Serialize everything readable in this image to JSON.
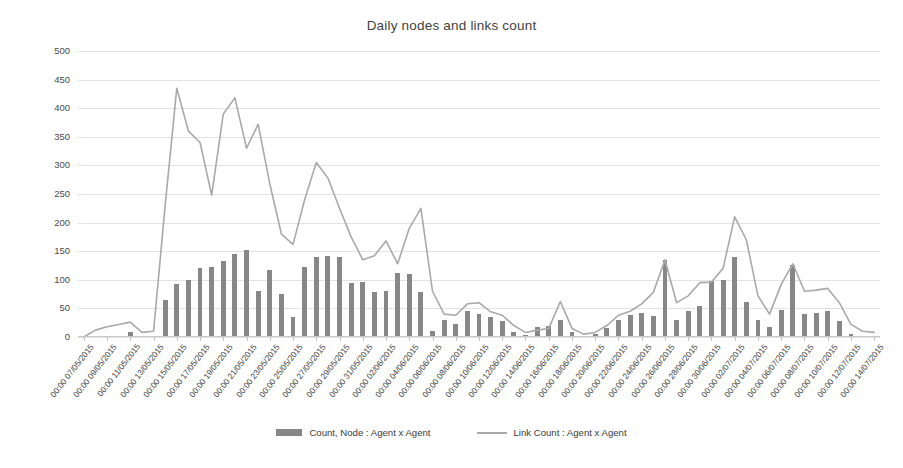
{
  "chart": {
    "title": "Daily nodes and links count",
    "legend": {
      "bar_label": "Count, Node : Agent x Agent",
      "line_label": "Link Count : Agent x Agent",
      "bar_color": "#878787",
      "line_color": "#a9a9a9",
      "position": "bottom"
    }
  },
  "chart_data": {
    "type": "bar",
    "title": "Daily nodes and links count",
    "xlabel": "",
    "ylabel": "",
    "ylim": [
      0,
      500
    ],
    "ytick_step": 50,
    "yticks": [
      0,
      50,
      100,
      150,
      200,
      250,
      300,
      350,
      400,
      450,
      500
    ],
    "grid": true,
    "x_tick_labels": [
      "00:00 07/05/2015",
      "00:00 09/05/2015",
      "00:00 11/05/2015",
      "00:00 13/05/2015",
      "00:00 15/05/2015",
      "00:00 17/05/2015",
      "00:00 19/05/2015",
      "00:00 21/05/2015",
      "00:00 23/05/2015",
      "00:00 25/05/2015",
      "00:00 27/05/2015",
      "00:00 29/05/2015",
      "00:00 31/05/2015",
      "00:00 02/06/2015",
      "00:00 04/06/2015",
      "00:00 06/06/2015",
      "00:00 08/06/2015",
      "00:00 10/06/2015",
      "00:00 12/06/2015",
      "00:00 14/06/2015",
      "00:00 16/06/2015",
      "00:00 18/06/2015",
      "00:00 20/06/2015",
      "00:00 22/06/2015",
      "00:00 24/06/2015",
      "00:00 26/06/2015",
      "00:00 28/06/2015",
      "00:00 30/06/2015",
      "00:00 02/07/2015",
      "00:00 04/07/2015",
      "00:00 06/07/2015",
      "00:00 08/07/2015",
      "00:00 10/07/2015",
      "00:00 12/07/2015",
      "00:00 14/07/2015"
    ],
    "categories": [
      "07/05/2015",
      "08/05/2015",
      "09/05/2015",
      "10/05/2015",
      "11/05/2015",
      "12/05/2015",
      "13/05/2015",
      "14/05/2015",
      "15/05/2015",
      "16/05/2015",
      "17/05/2015",
      "18/05/2015",
      "19/05/2015",
      "20/05/2015",
      "21/05/2015",
      "22/05/2015",
      "23/05/2015",
      "24/05/2015",
      "25/05/2015",
      "26/05/2015",
      "27/05/2015",
      "28/05/2015",
      "29/05/2015",
      "30/05/2015",
      "31/05/2015",
      "01/06/2015",
      "02/06/2015",
      "03/06/2015",
      "04/06/2015",
      "05/06/2015",
      "06/06/2015",
      "07/06/2015",
      "08/06/2015",
      "09/06/2015",
      "10/06/2015",
      "11/06/2015",
      "12/06/2015",
      "13/06/2015",
      "14/06/2015",
      "15/06/2015",
      "16/06/2015",
      "17/06/2015",
      "18/06/2015",
      "19/06/2015",
      "20/06/2015",
      "21/06/2015",
      "22/06/2015",
      "23/06/2015",
      "24/06/2015",
      "25/06/2015",
      "26/06/2015",
      "27/06/2015",
      "28/06/2015",
      "29/06/2015",
      "30/06/2015",
      "01/07/2015",
      "02/07/2015",
      "03/07/2015",
      "04/07/2015",
      "05/07/2015",
      "06/07/2015",
      "07/07/2015",
      "08/07/2015",
      "09/07/2015",
      "10/07/2015",
      "11/07/2015",
      "12/07/2015",
      "13/07/2015",
      "14/07/2015"
    ],
    "series": [
      {
        "name": "Count, Node : Agent x Agent",
        "type": "bar",
        "color": "#878787",
        "values": [
          0,
          0,
          0,
          0,
          8,
          0,
          0,
          65,
          92,
          100,
          120,
          122,
          133,
          145,
          152,
          80,
          118,
          75,
          35,
          123,
          140,
          141,
          140,
          95,
          97,
          78,
          80,
          112,
          110,
          78,
          10,
          30,
          22,
          45,
          40,
          35,
          28,
          8,
          3,
          18,
          20,
          30,
          8,
          2,
          5,
          16,
          30,
          38,
          42,
          36,
          135,
          30,
          45,
          55,
          98,
          100,
          140,
          62,
          30,
          18,
          48,
          126,
          40,
          42,
          45,
          28,
          5,
          2,
          0
        ]
      },
      {
        "name": "Link Count : Agent x Agent",
        "type": "line",
        "color": "#a9a9a9",
        "values": [
          0,
          12,
          18,
          22,
          26,
          8,
          10,
          230,
          435,
          360,
          340,
          248,
          390,
          418,
          330,
          372,
          268,
          180,
          162,
          240,
          305,
          278,
          225,
          175,
          135,
          142,
          168,
          128,
          190,
          225,
          80,
          40,
          38,
          58,
          60,
          44,
          38,
          20,
          8,
          12,
          15,
          62,
          15,
          5,
          8,
          20,
          38,
          45,
          58,
          78,
          135,
          60,
          72,
          95,
          96,
          120,
          210,
          170,
          72,
          40,
          92,
          128,
          80,
          82,
          85,
          60,
          22,
          10,
          8
        ]
      }
    ]
  }
}
